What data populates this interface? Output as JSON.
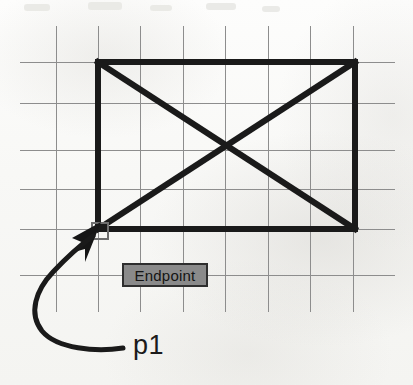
{
  "figure": {
    "canvas": {
      "width": 413,
      "height": 385
    },
    "background_color": "#fbfbfa"
  },
  "grid": {
    "line_color": "#8d8d8d",
    "line_width": 1,
    "vertical_x": [
      56,
      98,
      140,
      183,
      225,
      268,
      310,
      353
    ],
    "horizontal_y": [
      62,
      103,
      150,
      189,
      229,
      275
    ],
    "vertical_span": [
      26,
      312
    ],
    "horizontal_span": [
      20,
      395
    ]
  },
  "drawing": {
    "stroke_color": "#1a1a1a",
    "rectangle": {
      "left": 98,
      "top": 62,
      "right": 355,
      "bottom": 229,
      "line_width": 6
    },
    "diagonals": [
      {
        "name": "diagonal-top-left-to-bottom-right",
        "x1": 98,
        "y1": 62,
        "x2": 355,
        "y2": 229
      },
      {
        "name": "diagonal-bottom-left-to-top-right",
        "x1": 98,
        "y1": 229,
        "x2": 355,
        "y2": 62
      }
    ],
    "crossing_point": {
      "x": 226,
      "y": 146
    },
    "rubber_band": {
      "color": "#9a9a9a",
      "line_width": 2,
      "vertical": {
        "x": 99,
        "y1": 190,
        "y2": 228
      },
      "horizontal": {
        "y": 229,
        "x1": 100,
        "x2": 146
      }
    }
  },
  "snap_marker": {
    "name": "endpoint-snap-square",
    "x": 91,
    "y": 222,
    "size": 18,
    "border_color": "#6e6e6e",
    "border_width": 2
  },
  "cursor": {
    "name": "crosshair-arrow-cursor",
    "tip": {
      "x": 99,
      "y": 228
    },
    "color": "#161616"
  },
  "tooltip": {
    "label": "Endpoint",
    "left": 122,
    "top": 263,
    "width": 86,
    "height": 24,
    "background_color": "#8a8a8a",
    "border_color": "#2e2e2e",
    "text_color": "#141414"
  },
  "leader": {
    "name": "curved-leader-line",
    "color": "#1a1a1a",
    "line_width": 5,
    "path": "M 123 348 C 96 352, 57 349, 42 331 C 28 313, 36 290, 53 272 C 68 256, 84 243, 95 235",
    "arrow_head": {
      "points": "95 235, 72 246, 82 250, 74 258, 84 255, 84 265"
    }
  },
  "callout": {
    "label": "p1",
    "left": 133,
    "top": 330,
    "font_size": 27,
    "color": "#1b1b1b"
  },
  "scan_artifacts": {
    "note": "faint bleed-through text along the very top edge of the scan",
    "color": "#e8e8e4"
  }
}
